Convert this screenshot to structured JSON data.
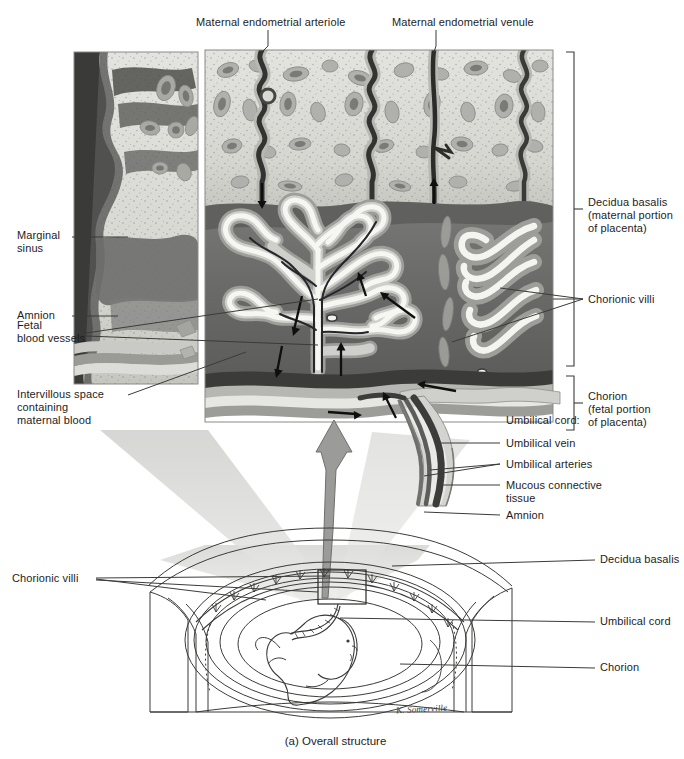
{
  "figure": {
    "caption": "(a) Overall structure",
    "signature": "K. Somerville"
  },
  "labels_top": [
    {
      "id": "maternal-endometrial-arteriole",
      "text": "Maternal endometrial arteriole"
    },
    {
      "id": "maternal-endometrial-venule",
      "text": "Maternal endometrial venule"
    }
  ],
  "labels_left": [
    {
      "id": "marginal-sinus",
      "text": "Marginal\nsinus"
    },
    {
      "id": "amnion-upper",
      "text": "Amnion"
    },
    {
      "id": "fetal-blood-vessels",
      "text": "Fetal\nblood vessels"
    },
    {
      "id": "intervillous-space",
      "text": "Intervillous space\ncontaining\nmaternal blood"
    },
    {
      "id": "chorionic-villi-lower",
      "text": "Chorionic villi"
    }
  ],
  "labels_right": [
    {
      "id": "decidua-basalis-bracket",
      "text": "Decidua basalis\n(maternal portion\nof placenta)"
    },
    {
      "id": "chorionic-villi-upper",
      "text": "Chorionic villi"
    },
    {
      "id": "chorion-bracket",
      "text": "Chorion\n(fetal portion\nof placenta)"
    },
    {
      "id": "umbilical-cord-heading",
      "text": "Umbilical cord:"
    },
    {
      "id": "umbilical-vein",
      "text": "Umbilical vein"
    },
    {
      "id": "umbilical-arteries",
      "text": "Umbilical arteries"
    },
    {
      "id": "mucous-connective-tissue",
      "text": "Mucous connective\ntissue"
    },
    {
      "id": "amnion-lower",
      "text": "Amnion"
    },
    {
      "id": "decidua-basalis-lower",
      "text": "Decidua basalis"
    },
    {
      "id": "umbilical-cord-lower",
      "text": "Umbilical cord"
    },
    {
      "id": "chorion-lower",
      "text": "Chorion"
    }
  ],
  "colors": {
    "ink": "#1d1d1d",
    "leader": "#333333",
    "decidua_light": "#dcdcd8",
    "decidua_mid": "#b9b9b4",
    "decidua_dark": "#8c8c88",
    "blood_space": "#6e6e6c",
    "blood_space_dark": "#565654",
    "vessel_dark": "#2f2f2f",
    "villus_core": "#fbfbf9",
    "cone": "#d8d8d6",
    "arrow_gray": "#9a9a98",
    "outline": "#4a4a4a"
  }
}
